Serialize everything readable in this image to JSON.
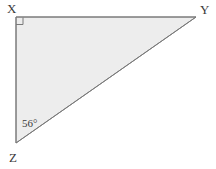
{
  "figure": {
    "kind": "right-triangle",
    "name": "Triangle XYZ",
    "background_color": "#ffffff",
    "fill_color": "#ededed",
    "stroke_color": "#7a7a7a",
    "stroke_width": 1,
    "label_color": "#3a3a3a",
    "width": 216,
    "height": 169
  },
  "vertices": {
    "x": {
      "label": "X",
      "point": [
        16,
        17
      ],
      "label_pos": [
        7,
        13
      ],
      "angle_type": "right-angle",
      "angle_value": "90°"
    },
    "y": {
      "label": "Y",
      "point": [
        196,
        17
      ],
      "label_pos": [
        200,
        14
      ]
    },
    "z": {
      "label": "Z",
      "point": [
        16,
        143
      ],
      "label_pos": [
        9,
        162
      ]
    }
  },
  "markers": {
    "right_angle": {
      "name": "right-angle-square",
      "vertex": "X",
      "size": 7
    },
    "angle_z": {
      "name": "angle-label-z",
      "text": "56°",
      "vertex": "Z",
      "pos": [
        22,
        127
      ]
    }
  },
  "sides": [
    {
      "name": "side-xy",
      "from": "X",
      "to": "Y",
      "orientation": "horizontal"
    },
    {
      "name": "side-xz",
      "from": "X",
      "to": "Z",
      "orientation": "vertical"
    },
    {
      "name": "side-zy",
      "from": "Z",
      "to": "Y",
      "orientation": "hypotenuse"
    }
  ]
}
